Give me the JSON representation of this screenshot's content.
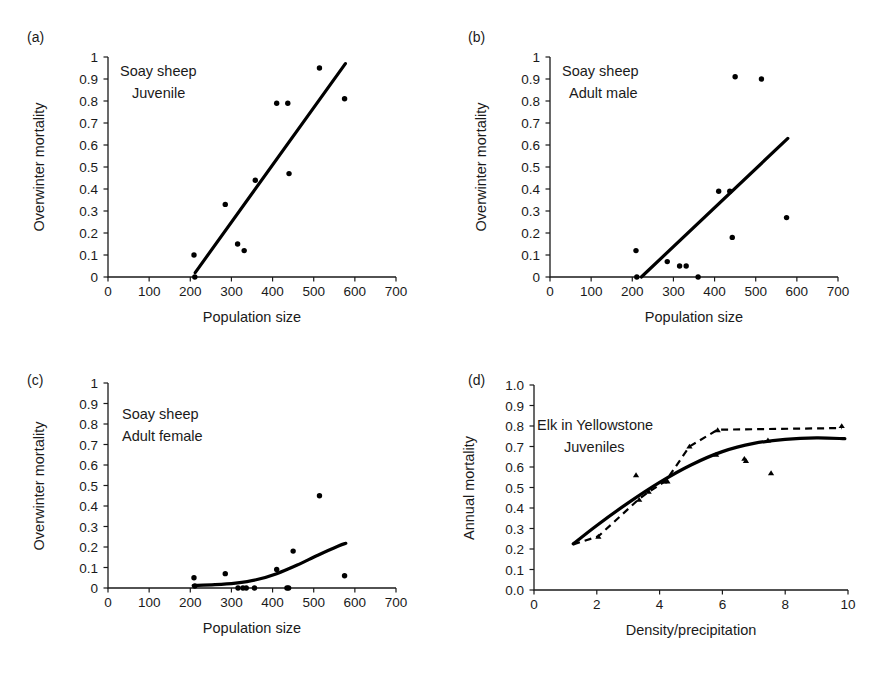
{
  "figure": {
    "background_color": "#ffffff",
    "line_color": "#000000",
    "text_color": "#1a1a1a"
  },
  "panels": {
    "a": {
      "letter": "(a)",
      "annotation_line1": "Soay sheep",
      "annotation_line2": "Juvenile"
    },
    "b": {
      "letter": "(b)",
      "annotation_line1": "Soay sheep",
      "annotation_line2": "Adult male"
    },
    "c": {
      "letter": "(c)",
      "annotation_line1": "Soay sheep",
      "annotation_line2": "Adult female"
    },
    "d": {
      "letter": "(d)",
      "annotation_line1": "Elk in Yellowstone",
      "annotation_line2": "Juveniles"
    }
  },
  "chart_data": [
    {
      "panel": "a",
      "type": "scatter",
      "title": "Soay sheep Juvenile",
      "xlabel": "Population size",
      "ylabel": "Overwinter mortality",
      "xlim": [
        0,
        700
      ],
      "ylim": [
        0,
        1
      ],
      "xticks": [
        0,
        100,
        200,
        300,
        400,
        500,
        600,
        700
      ],
      "xticklabels": [
        "0",
        "100",
        "200",
        "300",
        "400",
        "500",
        "600",
        "700"
      ],
      "yticks": [
        0,
        0.1,
        0.2,
        0.3,
        0.4,
        0.5,
        0.6,
        0.7,
        0.8,
        0.9,
        1
      ],
      "yticklabels": [
        "0",
        "0.1",
        "0.2",
        "0.3",
        "0.4",
        "0.5",
        "0.6",
        "0.7",
        "0.8",
        "0.9",
        "1"
      ],
      "grid": false,
      "legend": "none",
      "marker": "circle",
      "points": [
        {
          "x": 209,
          "y": 0.1
        },
        {
          "x": 211,
          "y": 0.0
        },
        {
          "x": 285,
          "y": 0.33
        },
        {
          "x": 315,
          "y": 0.15
        },
        {
          "x": 331,
          "y": 0.12
        },
        {
          "x": 358,
          "y": 0.44
        },
        {
          "x": 410,
          "y": 0.79
        },
        {
          "x": 437,
          "y": 0.79
        },
        {
          "x": 440,
          "y": 0.47
        },
        {
          "x": 514,
          "y": 0.95
        },
        {
          "x": 575,
          "y": 0.81
        }
      ],
      "fit": {
        "style": "solid",
        "kind": "linear",
        "points": [
          {
            "x": 212,
            "y": 0.02
          },
          {
            "x": 577,
            "y": 0.97
          }
        ]
      }
    },
    {
      "panel": "b",
      "type": "scatter",
      "title": "Soay sheep Adult male",
      "xlabel": "Population size",
      "ylabel": "Overwinter mortality",
      "xlim": [
        0,
        700
      ],
      "ylim": [
        0,
        1
      ],
      "xticks": [
        0,
        100,
        200,
        300,
        400,
        500,
        600,
        700
      ],
      "xticklabels": [
        "0",
        "100",
        "200",
        "300",
        "400",
        "500",
        "600",
        "700"
      ],
      "yticks": [
        0,
        0.1,
        0.2,
        0.3,
        0.4,
        0.5,
        0.6,
        0.7,
        0.8,
        0.9,
        1
      ],
      "yticklabels": [
        "0",
        "0.1",
        "0.2",
        "0.3",
        "0.4",
        "0.5",
        "0.6",
        "0.7",
        "0.8",
        "0.9",
        "1"
      ],
      "grid": false,
      "legend": "none",
      "marker": "circle",
      "points": [
        {
          "x": 209,
          "y": 0.12
        },
        {
          "x": 211,
          "y": 0.0
        },
        {
          "x": 285,
          "y": 0.07
        },
        {
          "x": 315,
          "y": 0.05
        },
        {
          "x": 331,
          "y": 0.05
        },
        {
          "x": 360,
          "y": 0.0
        },
        {
          "x": 410,
          "y": 0.39
        },
        {
          "x": 437,
          "y": 0.39
        },
        {
          "x": 443,
          "y": 0.18
        },
        {
          "x": 450,
          "y": 0.91
        },
        {
          "x": 514,
          "y": 0.9
        },
        {
          "x": 575,
          "y": 0.27
        }
      ],
      "fit": {
        "style": "solid",
        "kind": "linear",
        "points": [
          {
            "x": 222,
            "y": 0.0
          },
          {
            "x": 578,
            "y": 0.63
          }
        ]
      }
    },
    {
      "panel": "c",
      "type": "scatter",
      "title": "Soay sheep Adult female",
      "xlabel": "Population size",
      "ylabel": "Overwinter mortality",
      "xlim": [
        0,
        700
      ],
      "ylim": [
        0,
        1
      ],
      "xticks": [
        0,
        100,
        200,
        300,
        400,
        500,
        600,
        700
      ],
      "xticklabels": [
        "0",
        "100",
        "200",
        "300",
        "400",
        "500",
        "600",
        "700"
      ],
      "yticks": [
        0,
        0.1,
        0.2,
        0.3,
        0.4,
        0.5,
        0.6,
        0.7,
        0.8,
        0.9,
        1
      ],
      "yticklabels": [
        "0",
        "0.1",
        "0.2",
        "0.3",
        "0.4",
        "0.5",
        "0.6",
        "0.7",
        "0.8",
        "0.9",
        "1"
      ],
      "grid": false,
      "legend": "none",
      "marker": "circle",
      "points": [
        {
          "x": 209,
          "y": 0.05
        },
        {
          "x": 211,
          "y": 0.01
        },
        {
          "x": 285,
          "y": 0.07
        },
        {
          "x": 316,
          "y": 0.0
        },
        {
          "x": 328,
          "y": 0.0
        },
        {
          "x": 336,
          "y": 0.0
        },
        {
          "x": 356,
          "y": 0.0
        },
        {
          "x": 410,
          "y": 0.09
        },
        {
          "x": 435,
          "y": 0.0
        },
        {
          "x": 439,
          "y": 0.0
        },
        {
          "x": 450,
          "y": 0.18
        },
        {
          "x": 514,
          "y": 0.45
        },
        {
          "x": 575,
          "y": 0.06
        }
      ],
      "fit": {
        "style": "solid",
        "kind": "curve",
        "points": [
          {
            "x": 207,
            "y": 0.012
          },
          {
            "x": 260,
            "y": 0.016
          },
          {
            "x": 310,
            "y": 0.024
          },
          {
            "x": 360,
            "y": 0.04
          },
          {
            "x": 410,
            "y": 0.07
          },
          {
            "x": 460,
            "y": 0.112
          },
          {
            "x": 510,
            "y": 0.16
          },
          {
            "x": 560,
            "y": 0.205
          },
          {
            "x": 578,
            "y": 0.218
          }
        ]
      }
    },
    {
      "panel": "d",
      "type": "scatter",
      "title": "Elk in Yellowstone Juveniles",
      "xlabel": "Density/precipitation",
      "ylabel": "Annual mortality",
      "xlim": [
        0,
        10
      ],
      "ylim": [
        0,
        1
      ],
      "xticks": [
        0,
        2,
        4,
        6,
        8,
        10
      ],
      "xticklabels": [
        "0",
        "2",
        "4",
        "6",
        "8",
        "10"
      ],
      "yticks": [
        0,
        0.1,
        0.2,
        0.3,
        0.4,
        0.5,
        0.6,
        0.7,
        0.8,
        0.9,
        1
      ],
      "yticklabels": [
        "0.0",
        "0.1",
        "0.2",
        "0.3",
        "0.4",
        "0.5",
        "0.6",
        "0.7",
        "0.8",
        "0.9",
        "1.0"
      ],
      "grid": false,
      "legend": "none",
      "marker": "triangle",
      "points": [
        {
          "x": 2.05,
          "y": 0.26
        },
        {
          "x": 3.25,
          "y": 0.56
        },
        {
          "x": 3.35,
          "y": 0.44
        },
        {
          "x": 3.65,
          "y": 0.48
        },
        {
          "x": 4.15,
          "y": 0.53
        },
        {
          "x": 4.25,
          "y": 0.53
        },
        {
          "x": 4.95,
          "y": 0.7
        },
        {
          "x": 5.8,
          "y": 0.66
        },
        {
          "x": 5.85,
          "y": 0.78
        },
        {
          "x": 6.7,
          "y": 0.64
        },
        {
          "x": 6.75,
          "y": 0.63
        },
        {
          "x": 7.45,
          "y": 0.73
        },
        {
          "x": 7.55,
          "y": 0.57
        },
        {
          "x": 9.8,
          "y": 0.8
        }
      ],
      "fit": {
        "style": "solid",
        "kind": "curve",
        "points": [
          {
            "x": 1.25,
            "y": 0.225
          },
          {
            "x": 2.0,
            "y": 0.315
          },
          {
            "x": 3.0,
            "y": 0.425
          },
          {
            "x": 4.0,
            "y": 0.525
          },
          {
            "x": 5.0,
            "y": 0.61
          },
          {
            "x": 6.0,
            "y": 0.675
          },
          {
            "x": 7.0,
            "y": 0.715
          },
          {
            "x": 8.0,
            "y": 0.735
          },
          {
            "x": 9.0,
            "y": 0.742
          },
          {
            "x": 9.9,
            "y": 0.738
          }
        ]
      },
      "fit_secondary": {
        "style": "dashed",
        "kind": "polyline",
        "points": [
          {
            "x": 1.25,
            "y": 0.222
          },
          {
            "x": 2.05,
            "y": 0.262
          },
          {
            "x": 3.35,
            "y": 0.445
          },
          {
            "x": 3.65,
            "y": 0.478
          },
          {
            "x": 4.2,
            "y": 0.532
          },
          {
            "x": 4.95,
            "y": 0.7
          },
          {
            "x": 5.85,
            "y": 0.782
          },
          {
            "x": 9.8,
            "y": 0.79
          }
        ]
      }
    }
  ]
}
